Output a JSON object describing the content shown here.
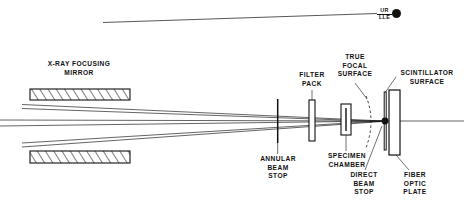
{
  "figure": {
    "type": "optical-ray-diagram",
    "title_visible": false,
    "background": "#ffffff",
    "ink": "#111111"
  },
  "logo": {
    "line1": "UR",
    "line2": "LLE",
    "mark": "filled-circle",
    "color": "#111111"
  },
  "labels": {
    "mirror": "X-RAY FOCUSING\nMIRROR",
    "filter_pack": "FILTER\nPACK",
    "annular_beam_stop": "ANNULAR\nBEAM\nSTOP",
    "true_focal_surface": "TRUE\nFOCAL\nSURFACE",
    "specimen_chamber": "SPECIMEN\nCHAMBER",
    "scintillator_surface": "SCINTILLATOR\nSURFACE",
    "direct_beam_stop": "DIRECT\nBEAM\nSTOP",
    "fiber_optic_plate": "FIBER\nOPTIC\nPLATE"
  },
  "components": {
    "mirror_top": {
      "x": 30,
      "y": 89,
      "w": 100,
      "h": 11,
      "fill": "hatched"
    },
    "mirror_bottom": {
      "x": 30,
      "y": 151,
      "w": 100,
      "h": 12,
      "fill": "hatched"
    },
    "annular_beam_stop": {
      "x": 277,
      "y": 99,
      "w": 1.4,
      "h": 44
    },
    "filter_pack": {
      "x": 309,
      "y": 100,
      "w": 6,
      "h": 41
    },
    "specimen_chamber": {
      "x": 341,
      "y": 104,
      "w": 10,
      "h": 31
    },
    "scintillator": {
      "x": 385,
      "y": 92,
      "w": 2,
      "h": 58
    },
    "fiber_optic_plate": {
      "x": 389,
      "y": 90,
      "w": 11,
      "h": 65
    },
    "direct_beam_stop": {
      "cx": 385,
      "cy": 121,
      "r": 3.4
    }
  },
  "rays": {
    "count": 6,
    "description": "converging X-ray bundle crossing near the focal plane",
    "optical_axis_y": 121
  }
}
